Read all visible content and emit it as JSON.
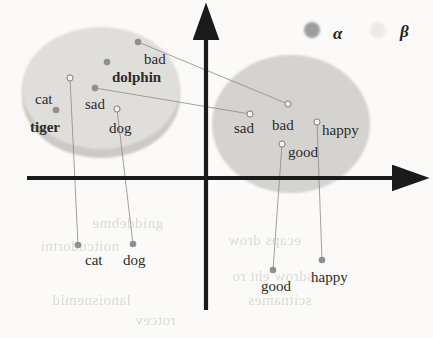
{
  "figure": {
    "background_color": "#fbfaf8",
    "width": 433,
    "height": 338
  },
  "legend": {
    "alpha": {
      "label": "α",
      "marker": "filled-circle",
      "color": "#9d9d9d",
      "x": 312,
      "y": 30,
      "label_x": 333,
      "label_y": 24
    },
    "beta": {
      "label": "β",
      "marker": "hollow-circle",
      "color": "#cfcfcf",
      "x": 378,
      "y": 30,
      "label_x": 400,
      "label_y": 22
    }
  },
  "axes": {
    "x_axis": {
      "x1": 27,
      "y1": 178,
      "x2": 396,
      "y2": 178,
      "color": "#1a1a1a",
      "arrow": "right"
    },
    "y_axis": {
      "x1": 206,
      "y1": 310,
      "x2": 206,
      "y2": 36,
      "color": "#1a1a1a",
      "arrow": "up"
    }
  },
  "clusters": [
    {
      "name": "alpha-cluster",
      "space": "α",
      "fill": "#e0dedb",
      "shadow_fill": "#cdcac5",
      "cx": 101,
      "cy": 88,
      "rx": 79,
      "ry": 61
    },
    {
      "name": "beta-cluster",
      "space": "β",
      "fill": "#d5d3cf",
      "shadow_fill": "#d5d3cf",
      "cx": 291,
      "cy": 124,
      "rx": 79,
      "ry": 69
    }
  ],
  "chart_data": {
    "type": "scatter",
    "xlabel": "",
    "ylabel": "",
    "grid": false,
    "legend": [
      "α",
      "β"
    ],
    "legend_position": "top-right",
    "series": [
      {
        "name": "α",
        "marker": "filled-circle",
        "color": "#8f8f8f",
        "points": [
          {
            "label": "bad",
            "x": 138,
            "y": 42,
            "label_x": 144,
            "label_y": 52,
            "bold": false
          },
          {
            "label": "dolphin",
            "x": 107,
            "y": 62,
            "label_x": 112,
            "label_y": 70,
            "bold": true
          },
          {
            "label": "sad",
            "x": 95,
            "y": 88,
            "label_x": 85,
            "label_y": 97,
            "bold": false
          },
          {
            "label": "tiger",
            "x": 56,
            "y": 110,
            "label_x": 30,
            "label_y": 120,
            "bold": true
          },
          {
            "label": "cat",
            "x": 78,
            "y": 245,
            "label_x": 85,
            "label_y": 253,
            "bold": false
          },
          {
            "label": "dog",
            "x": 133,
            "y": 244,
            "label_x": 123,
            "label_y": 253,
            "bold": false
          },
          {
            "label": "good",
            "x": 273,
            "y": 270,
            "label_x": 261,
            "label_y": 279,
            "bold": false
          },
          {
            "label": "happy",
            "x": 322,
            "y": 260,
            "label_x": 311,
            "label_y": 270,
            "bold": false
          }
        ]
      },
      {
        "name": "β",
        "marker": "hollow-circle",
        "color": "#8f8f8f",
        "points": [
          {
            "label": "cat",
            "x": 70,
            "y": 78,
            "label_x": 35,
            "label_y": 92,
            "bold": false
          },
          {
            "label": "dog",
            "x": 117,
            "y": 109,
            "label_x": 109,
            "label_y": 121,
            "bold": false
          },
          {
            "label": "bad",
            "x": 288,
            "y": 104,
            "label_x": 272,
            "label_y": 118,
            "bold": false
          },
          {
            "label": "sad",
            "x": 250,
            "y": 114,
            "label_x": 234,
            "label_y": 121,
            "bold": false
          },
          {
            "label": "happy",
            "x": 317,
            "y": 122,
            "label_x": 322,
            "label_y": 123,
            "bold": false
          },
          {
            "label": "good",
            "x": 282,
            "y": 144,
            "label_x": 288,
            "label_y": 145,
            "bold": false
          }
        ]
      }
    ],
    "alignment_links": [
      {
        "from": "α.bad",
        "x1": 138,
        "y1": 42,
        "x2": 288,
        "y2": 104
      },
      {
        "from": "α.sad",
        "x1": 95,
        "y1": 88,
        "x2": 250,
        "y2": 114
      },
      {
        "from": "β.cat",
        "x1": 70,
        "y1": 78,
        "x2": 78,
        "y2": 245
      },
      {
        "from": "β.dog",
        "x1": 117,
        "y1": 109,
        "x2": 133,
        "y2": 244
      },
      {
        "from": "β.good",
        "x1": 282,
        "y1": 144,
        "x2": 273,
        "y2": 270
      },
      {
        "from": "β.happy",
        "x1": 317,
        "y1": 122,
        "x2": 322,
        "y2": 260
      }
    ]
  },
  "artifacts": {
    "note": "scanned-page bleed-through text visible behind figure",
    "marks": [
      {
        "text": "noitatneserper",
        "x": 58,
        "y": 46,
        "size": 15
      },
      {
        "text": "gniddebme",
        "x": 92,
        "y": 215,
        "size": 15
      },
      {
        "text": "noitcudortni",
        "x": 40,
        "y": 238,
        "size": 15
      },
      {
        "text": "lanoisnemid",
        "x": 52,
        "y": 292,
        "size": 15
      },
      {
        "text": "rotcev",
        "x": 135,
        "y": 312,
        "size": 15
      },
      {
        "text": "ecaps drow",
        "x": 228,
        "y": 232,
        "size": 15
      },
      {
        "text": "sdrow eht ro",
        "x": 232,
        "y": 268,
        "size": 15
      },
      {
        "text": "scitnames",
        "x": 248,
        "y": 292,
        "size": 15
      }
    ]
  }
}
